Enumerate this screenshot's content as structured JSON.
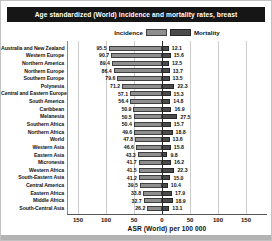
{
  "title": "Age standardized (World) incidence and mortality rates, breast",
  "legend": {
    "incidence_label": "Incidence",
    "mortality_label": "Mortality"
  },
  "axis": {
    "label": "ASR (World) per 100 000",
    "tick_values": [
      -150,
      -100,
      -50,
      0,
      50,
      100,
      150
    ],
    "tick_labels": [
      "150",
      "100",
      "50",
      "0",
      "50",
      "100",
      "150"
    ],
    "max": 150
  },
  "colors": {
    "title_bg": "#161616",
    "incidence_fill": "#8f8f8f",
    "incidence_border": "#3f3f3f",
    "mortality_fill": "#4b4b4b",
    "mortality_border": "#262626"
  },
  "chart_data": {
    "type": "bar",
    "orientation": "diverging-horizontal",
    "title": "Age standardized (World) incidence and mortality rates, breast",
    "xlabel": "ASR (World) per 100 000",
    "xlim": [
      -150,
      150
    ],
    "grid": true,
    "legend_position": "top-center",
    "categories": [
      "Australia and New Zealand",
      "Western Europe",
      "Northern America",
      "Northern Europe",
      "Southern Europe",
      "Polynesia",
      "Central and Eastern Europe",
      "South America",
      "Caribbean",
      "Melanesia",
      "Southern Africa",
      "Northern Africa",
      "World",
      "Western Asia",
      "Eastern Asia",
      "Micronesia",
      "Western Africa",
      "South-Eastern Asia",
      "Central America",
      "Eastern Africa",
      "Middle Africa",
      "South-Central Asia"
    ],
    "series": [
      {
        "name": "Incidence",
        "direction": "left",
        "values": [
          95.5,
          90.7,
          89.4,
          86.4,
          79.6,
          71.2,
          57.1,
          56.4,
          50.9,
          50.5,
          50.4,
          49.6,
          47.8,
          46.6,
          43.3,
          41.7,
          41.5,
          41.2,
          39.5,
          33.8,
          32.7,
          26.2
        ]
      },
      {
        "name": "Mortality",
        "direction": "right",
        "values": [
          12.1,
          15.6,
          12.5,
          13.7,
          13.5,
          22.3,
          15.3,
          14.8,
          16.9,
          27.5,
          15.7,
          18.8,
          13.6,
          15.8,
          9.8,
          16.2,
          22.3,
          15.0,
          10.4,
          17.9,
          18.9,
          13.1
        ]
      }
    ]
  }
}
